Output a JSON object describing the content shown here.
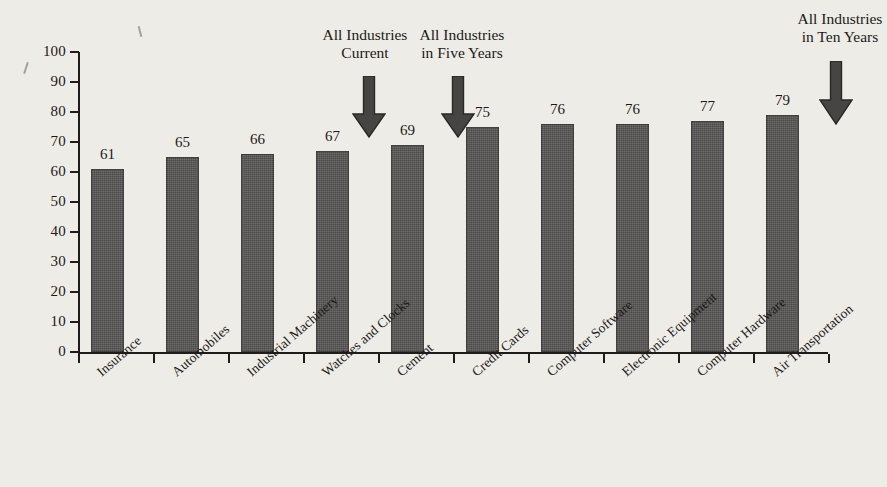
{
  "chart_data": {
    "type": "bar",
    "title": "",
    "subtitle": "",
    "xlabel": "",
    "ylabel": "",
    "ylim": [
      0,
      100
    ],
    "yticks": [
      0,
      10,
      20,
      30,
      40,
      50,
      60,
      70,
      80,
      90,
      100
    ],
    "grid": false,
    "legend": "none",
    "bar_color": "#4c4a49",
    "background_color": "#eeece7",
    "categories": [
      "Insurance",
      "Automobiles",
      "Industrial Machinery",
      "Watches and Clocks",
      "Cement",
      "Credit Cards",
      "Computer Software",
      "Electronic Equipment",
      "Computer Hardware",
      "Air Transportation"
    ],
    "values": [
      61,
      65,
      66,
      67,
      69,
      75,
      76,
      76,
      77,
      79
    ],
    "value_labels": [
      "61",
      "65",
      "66",
      "67",
      "69",
      "75",
      "76",
      "76",
      "77",
      "79"
    ],
    "annotations": [
      {
        "id": "all-industries-current",
        "line1": "All Industries",
        "line2": "Current",
        "arrow": "down-arrow-icon",
        "points_between_categories": [
          "Watches and Clocks",
          "Cement"
        ]
      },
      {
        "id": "all-industries-five-years",
        "line1": "All Industries",
        "line2": "in Five Years",
        "arrow": "down-arrow-icon",
        "points_between_categories": [
          "Cement",
          "Credit Cards"
        ]
      },
      {
        "id": "all-industries-ten-years",
        "line1": "All Industries",
        "line2": "in Ten Years",
        "arrow": "down-arrow-icon",
        "points_between_categories": [
          "Air Transportation",
          ""
        ]
      }
    ]
  }
}
